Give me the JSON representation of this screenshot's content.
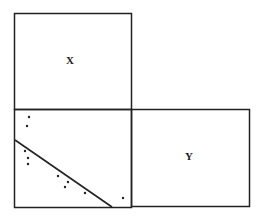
{
  "diagram": {
    "boxes": [
      {
        "id": "x-box",
        "label": "X",
        "x": 14,
        "y": 13,
        "width": 117,
        "height": 96,
        "label_pos": [
          70,
          60
        ]
      },
      {
        "id": "scatter-box",
        "label": "",
        "x": 14,
        "y": 109,
        "width": 117,
        "height": 98
      },
      {
        "id": "y-box",
        "label": "Y",
        "x": 131,
        "y": 109,
        "width": 118,
        "height": 97,
        "label_pos": [
          189,
          156
        ]
      }
    ],
    "scatter": {
      "points": [
        [
          29,
          117
        ],
        [
          27,
          126
        ],
        [
          25,
          151
        ],
        [
          28,
          158
        ],
        [
          28,
          164
        ],
        [
          58,
          176
        ],
        [
          68,
          182
        ],
        [
          65,
          187
        ],
        [
          85,
          193
        ],
        [
          123,
          198
        ]
      ],
      "fit_line": {
        "x1": 15,
        "y1": 140,
        "x2": 112,
        "y2": 207
      }
    },
    "colors": {
      "stroke": "#222222",
      "background": "#ffffff"
    }
  },
  "labels": {
    "x": "X",
    "y": "Y"
  }
}
